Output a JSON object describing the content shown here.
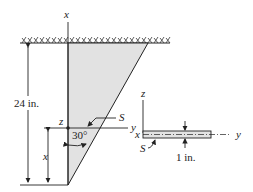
{
  "diagram": {
    "labels": {
      "x_axis_top": "x",
      "height": "24 in.",
      "z_main": "z",
      "y_main": "y",
      "section": "S",
      "angle": "30°",
      "x_dist": "x",
      "cs_z": "z",
      "cs_x": "x",
      "cs_y": "y",
      "cs_section": "S",
      "thickness": "1 in."
    },
    "colors": {
      "plate_fill": "#e2e2e2",
      "line": "#222222"
    }
  }
}
